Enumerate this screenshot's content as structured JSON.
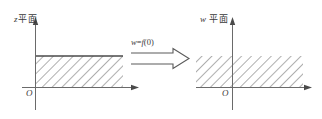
{
  "figure": {
    "title": "",
    "background_color": "#ffffff",
    "ink_color": "#4a4a4a",
    "hatch_color": "#6b6b6b"
  },
  "left_plot": {
    "plane_label_var": "z",
    "plane_label_text": "平面",
    "origin_label": "O",
    "axes": {
      "vertical_axis_name": "imaginary-axis",
      "horizontal_axis_name": "real-axis"
    },
    "region": {
      "description": "hatched-rectangle",
      "has_solid_top_border": true,
      "spans_left_of_axis": false
    }
  },
  "mapping": {
    "formula_lhs": "w",
    "formula_eq": "=",
    "formula_fn": "f",
    "formula_arg": "(0)",
    "formula_full": "w=f(0)",
    "arrow_name": "double-line-right-arrow"
  },
  "right_plot": {
    "plane_label_var": "w",
    "plane_label_text": "平面",
    "origin_label": "O",
    "axes": {
      "vertical_axis_name": "imaginary-axis",
      "horizontal_axis_name": "real-axis"
    },
    "region": {
      "description": "hatched-band",
      "has_solid_top_border": false,
      "spans_left_of_axis": true
    }
  }
}
